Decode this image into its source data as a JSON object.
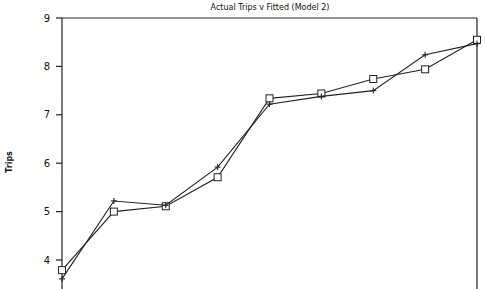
{
  "chart_data": {
    "type": "line",
    "title": "Actual Trips v Fitted (Model 2)",
    "xlabel": "",
    "ylabel": "Trips",
    "ylim": [
      3.6,
      9
    ],
    "yticks": [
      "4",
      "5",
      "6",
      "7",
      "8",
      "9"
    ],
    "ytick_values": [
      4,
      5,
      6,
      7,
      8,
      9
    ],
    "x": [
      1,
      2,
      3,
      4,
      5,
      6,
      7,
      8,
      9
    ],
    "grid": false,
    "legend": "none",
    "series": [
      {
        "name": "Actual",
        "marker": "square",
        "values": [
          3.79,
          5.0,
          5.11,
          5.71,
          7.34,
          7.44,
          7.74,
          7.94,
          8.55
        ]
      },
      {
        "name": "Fitted",
        "marker": "plus",
        "values": [
          3.61,
          5.22,
          5.13,
          5.92,
          7.22,
          7.38,
          7.5,
          8.24,
          8.47
        ]
      }
    ]
  }
}
